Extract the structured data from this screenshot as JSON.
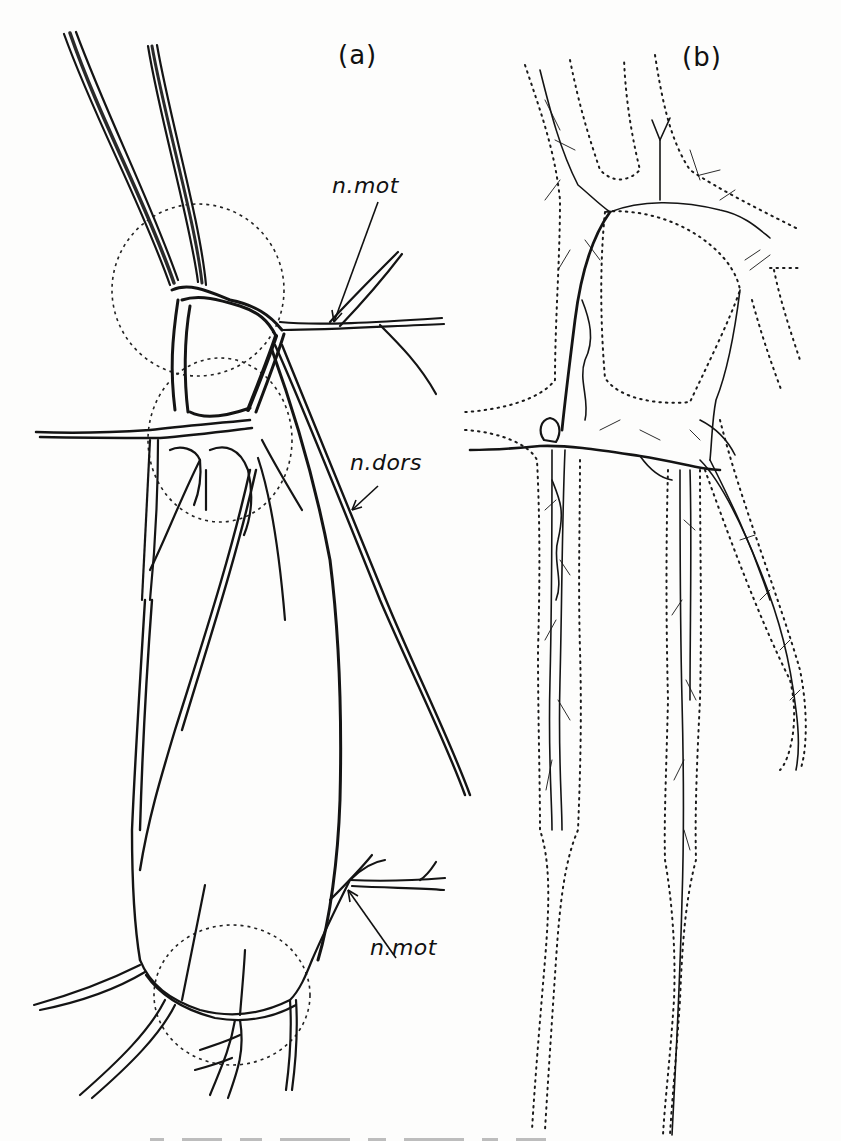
{
  "figure": {
    "panels": [
      {
        "id": "a",
        "label": "(a)"
      },
      {
        "id": "b",
        "label": "(b)"
      }
    ],
    "annotations": [
      {
        "text": "n.mot",
        "panel": "a",
        "position": "upper"
      },
      {
        "text": "n.dors",
        "panel": "a",
        "position": "middle"
      },
      {
        "text": "n.mot",
        "panel": "a",
        "position": "lower"
      }
    ],
    "caption": {
      "visible": "truncated at bottom edge (illegible)"
    }
  }
}
